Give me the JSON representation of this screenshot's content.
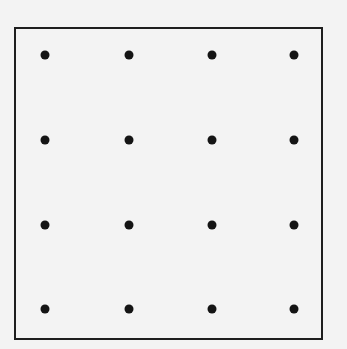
{
  "diagram": {
    "type": "dot-grid",
    "rows": 4,
    "columns": 4,
    "dot_color": "#141414",
    "border_color": "#1e1e1e",
    "background": "#f3f3f3",
    "dot_x": [
      45,
      129,
      212,
      294
    ],
    "dot_y": [
      55,
      140,
      225,
      309
    ]
  }
}
